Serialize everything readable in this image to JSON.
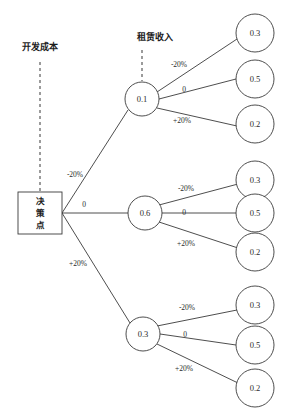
{
  "diagram": {
    "type": "decision-tree",
    "annotations": [
      {
        "id": "development-cost",
        "label": "开发成本",
        "x": 40,
        "y": 47
      },
      {
        "id": "rental-income",
        "label": "租赁收入",
        "x": 155,
        "y": 37
      }
    ],
    "decision_node": {
      "id": "decision-point",
      "label_lines": [
        "决",
        "策",
        "点"
      ],
      "x": 40,
      "y": 213,
      "width": 44,
      "height": 42
    },
    "level1_nodes": [
      {
        "id": "level1-node-1",
        "value": "0.1",
        "x": 142,
        "y": 99,
        "r": 17
      },
      {
        "id": "level1-node-2",
        "value": "0.6",
        "x": 145,
        "y": 213,
        "r": 17
      },
      {
        "id": "level1-node-3",
        "value": "0.3",
        "x": 143,
        "y": 334,
        "r": 17
      }
    ],
    "leaf_nodes": [
      {
        "id": "leaf-1-1",
        "value": "0.3",
        "x": 255,
        "y": 33,
        "r": 19
      },
      {
        "id": "leaf-1-2",
        "value": "0.5",
        "x": 255,
        "y": 79,
        "r": 19
      },
      {
        "id": "leaf-1-3",
        "value": "0.2",
        "x": 255,
        "y": 124,
        "r": 19
      },
      {
        "id": "leaf-2-1",
        "value": "0.3",
        "x": 255,
        "y": 180,
        "r": 19
      },
      {
        "id": "leaf-2-2",
        "value": "0.5",
        "x": 255,
        "y": 213,
        "r": 19
      },
      {
        "id": "leaf-2-3",
        "value": "0.2",
        "x": 255,
        "y": 252,
        "r": 19
      },
      {
        "id": "leaf-3-1",
        "value": "0.3",
        "x": 255,
        "y": 305,
        "r": 19
      },
      {
        "id": "leaf-3-2",
        "value": "0.5",
        "x": 255,
        "y": 345,
        "r": 19
      },
      {
        "id": "leaf-3-3",
        "value": "0.2",
        "x": 255,
        "y": 388,
        "r": 19
      }
    ],
    "root_edge_labels": [
      {
        "id": "root-edge-minus20",
        "label": "-20%",
        "x": 75,
        "y": 174
      },
      {
        "id": "root-edge-zero",
        "label": "0",
        "x": 84,
        "y": 204
      },
      {
        "id": "root-edge-plus20",
        "label": "+20%",
        "x": 78,
        "y": 263
      }
    ],
    "branch_edge_labels": [
      {
        "id": "b1-edge-minus20",
        "label": "-20%",
        "x": 179,
        "y": 64
      },
      {
        "id": "b1-edge-zero",
        "label": "0",
        "x": 184,
        "y": 89
      },
      {
        "id": "b1-edge-plus20",
        "label": "+20%",
        "x": 182,
        "y": 120
      },
      {
        "id": "b2-edge-minus20",
        "label": "-20%",
        "x": 186,
        "y": 188
      },
      {
        "id": "b2-edge-zero",
        "label": "0",
        "x": 184,
        "y": 212
      },
      {
        "id": "b2-edge-plus20",
        "label": "+20%",
        "x": 186,
        "y": 243
      },
      {
        "id": "b3-edge-minus20",
        "label": "-20%",
        "x": 187,
        "y": 307
      },
      {
        "id": "b3-edge-zero",
        "label": "0",
        "x": 185,
        "y": 334
      },
      {
        "id": "b3-edge-plus20",
        "label": "+20%",
        "x": 184,
        "y": 368
      }
    ]
  }
}
